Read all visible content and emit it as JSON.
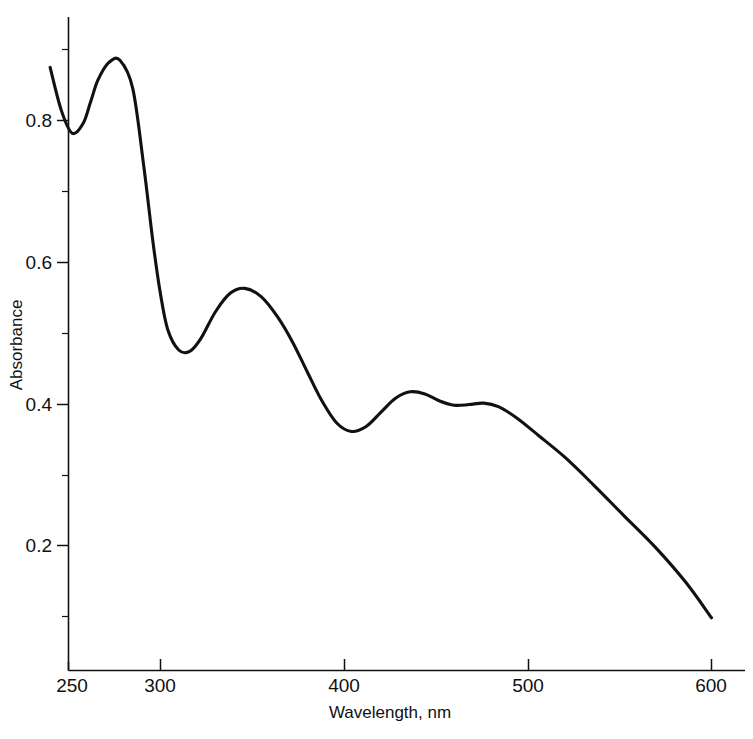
{
  "chart_data": {
    "type": "line",
    "title": "",
    "xlabel": "Wavelength, nm",
    "ylabel": "Absorbance",
    "xlim": [
      240,
      600
    ],
    "ylim": [
      0.0,
      0.92
    ],
    "grid": false,
    "legend": null,
    "x_ticks": [
      250,
      300,
      400,
      500,
      600
    ],
    "x_tick_labels": [
      "250",
      "300",
      "400",
      "500",
      "600"
    ],
    "x_minor_ticks": [
      350,
      450,
      550
    ],
    "y_ticks": [
      0.2,
      0.4,
      0.6,
      0.8
    ],
    "y_tick_labels": [
      "0.2",
      "0.4",
      "0.6",
      "0.8"
    ],
    "y_minor_ticks": [
      0.1,
      0.3,
      0.5,
      0.7
    ],
    "line_color": "#111111",
    "series": [
      {
        "name": "Absorbance spectrum",
        "x": [
          240,
          246,
          252,
          258,
          262,
          266,
          272,
          278,
          285,
          291,
          296,
          300,
          304,
          310,
          316,
          322,
          330,
          338,
          346,
          355,
          364,
          372,
          380,
          388,
          396,
          404,
          412,
          420,
          428,
          436,
          444,
          452,
          460,
          468,
          476,
          484,
          494,
          506,
          520,
          536,
          552,
          570,
          586,
          600
        ],
        "y": [
          0.875,
          0.815,
          0.782,
          0.796,
          0.826,
          0.857,
          0.882,
          0.885,
          0.845,
          0.735,
          0.628,
          0.556,
          0.505,
          0.476,
          0.474,
          0.492,
          0.53,
          0.556,
          0.563,
          0.551,
          0.522,
          0.487,
          0.445,
          0.404,
          0.373,
          0.361,
          0.368,
          0.388,
          0.408,
          0.417,
          0.414,
          0.404,
          0.398,
          0.399,
          0.401,
          0.396,
          0.38,
          0.355,
          0.325,
          0.285,
          0.243,
          0.196,
          0.148,
          0.098
        ]
      }
    ],
    "annotations": []
  },
  "axes": {
    "y_label": "Absorbance",
    "x_label": "Wavelength, nm",
    "y_tick_labels": [
      "0.8",
      "0.6",
      "0.4",
      "0.2"
    ],
    "x_tick_labels": [
      "250",
      "300",
      "400",
      "500",
      "600"
    ]
  },
  "colors": {
    "background": "#ffffff",
    "ink": "#111111"
  }
}
